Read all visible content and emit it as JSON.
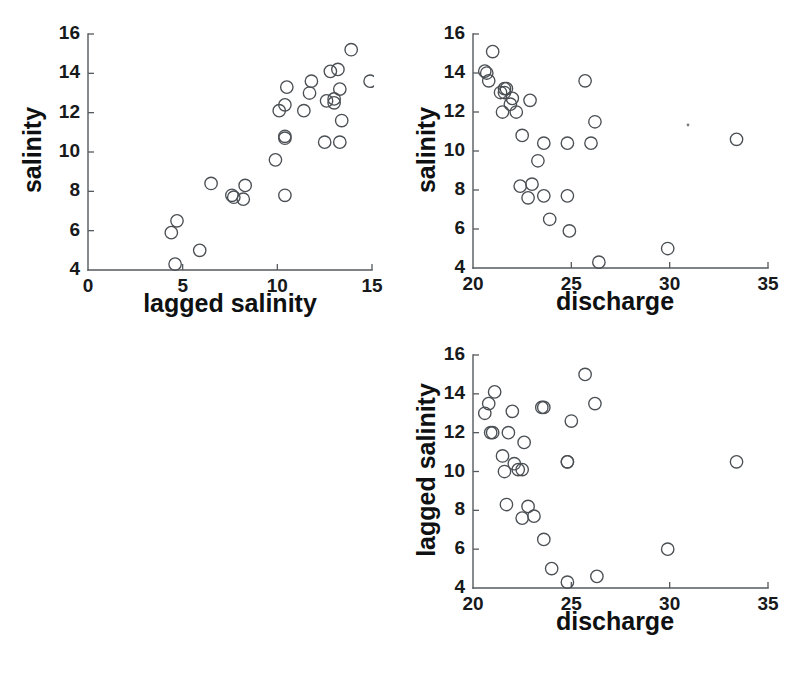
{
  "figure": {
    "background_color": "#ffffff",
    "marker_color": "#4a4f54",
    "axis_color": "#555a5e",
    "text_color": "#17191b",
    "marker_shape": "open-circle",
    "layout": "scatter-plot-matrix-lower-triangle",
    "panel_count": 3
  },
  "chart_data": [
    {
      "id": "panel-salinity-vs-lagged-salinity",
      "type": "scatter",
      "title": "",
      "xlabel": "lagged salinity",
      "ylabel": "salinity",
      "xlim": [
        0,
        15
      ],
      "ylim": [
        4,
        16
      ],
      "xticks": [
        0,
        5,
        10,
        15
      ],
      "yticks": [
        4,
        6,
        8,
        10,
        12,
        14,
        16
      ],
      "xtick_labels": [
        "0",
        "5",
        "10",
        "15"
      ],
      "ytick_labels": [
        "4",
        "6",
        "8",
        "10",
        "12",
        "14",
        "16"
      ],
      "grid": false,
      "legend": false,
      "x": [
        13.9,
        12.8,
        13.2,
        11.8,
        11.7,
        13.3,
        10.5,
        10.1,
        10.4,
        13.0,
        13.0,
        12.6,
        11.4,
        9.9,
        14.9,
        13.4,
        10.4,
        10.4,
        12.5,
        13.3,
        7.6,
        8.3,
        8.2,
        6.5,
        7.7,
        5.9,
        4.7,
        4.4,
        4.6,
        10.4
      ],
      "y": [
        15.2,
        14.1,
        14.2,
        13.6,
        13.0,
        13.2,
        13.3,
        12.1,
        12.4,
        12.7,
        12.5,
        12.6,
        12.1,
        9.6,
        13.6,
        11.6,
        10.8,
        10.7,
        10.5,
        10.5,
        7.8,
        8.3,
        7.6,
        8.4,
        7.7,
        5.0,
        6.5,
        5.9,
        4.3,
        7.8
      ]
    },
    {
      "id": "panel-salinity-vs-discharge",
      "type": "scatter",
      "title": "",
      "xlabel": "discharge",
      "ylabel": "salinity",
      "xlim": [
        20,
        35
      ],
      "ylim": [
        4,
        16
      ],
      "xticks": [
        20,
        25,
        30,
        35
      ],
      "yticks": [
        4,
        6,
        8,
        10,
        12,
        14,
        16
      ],
      "xtick_labels": [
        "20",
        "25",
        "30",
        "35"
      ],
      "ytick_labels": [
        "4",
        "6",
        "8",
        "10",
        "12",
        "14",
        "16"
      ],
      "grid": false,
      "legend": false,
      "x": [
        21.0,
        20.6,
        20.7,
        20.8,
        21.4,
        21.6,
        21.7,
        22.0,
        21.9,
        21.5,
        22.2,
        22.9,
        23.6,
        25.7,
        22.5,
        23.3,
        24.8,
        26.2,
        33.4,
        22.4,
        21.6,
        23.0,
        22.8,
        23.6,
        24.8,
        23.9,
        24.9,
        26.4,
        29.9,
        26.0
      ],
      "y": [
        15.1,
        14.1,
        14.0,
        13.6,
        13.0,
        13.2,
        13.2,
        12.7,
        12.4,
        12.0,
        12.0,
        12.6,
        10.4,
        13.6,
        10.8,
        9.5,
        10.4,
        11.5,
        10.6,
        8.2,
        13.0,
        8.3,
        7.6,
        7.7,
        7.7,
        6.5,
        5.9,
        4.3,
        5.0,
        10.4
      ]
    },
    {
      "id": "panel-lagged-salinity-vs-discharge",
      "type": "scatter",
      "title": "",
      "xlabel": "discharge",
      "ylabel": "lagged salinity",
      "xlim": [
        20,
        35
      ],
      "ylim": [
        4,
        16
      ],
      "xticks": [
        20,
        25,
        30,
        35
      ],
      "yticks": [
        4,
        6,
        8,
        10,
        12,
        14,
        16
      ],
      "xtick_labels": [
        "20",
        "25",
        "30",
        "35"
      ],
      "ytick_labels": [
        "4",
        "6",
        "8",
        "10",
        "12",
        "14",
        "16"
      ],
      "grid": false,
      "legend": false,
      "x": [
        25.7,
        21.1,
        20.8,
        20.6,
        22.0,
        23.5,
        23.6,
        26.2,
        25.0,
        21.0,
        20.9,
        21.8,
        22.6,
        24.8,
        21.5,
        22.1,
        21.6,
        22.3,
        24.8,
        21.7,
        22.8,
        23.1,
        22.5,
        23.6,
        29.9,
        24.0,
        24.8,
        26.3,
        33.4,
        22.5
      ],
      "y": [
        15.0,
        14.1,
        13.5,
        13.0,
        13.1,
        13.3,
        13.3,
        13.5,
        12.6,
        12.0,
        12.0,
        12.0,
        11.5,
        10.5,
        10.8,
        10.4,
        10.0,
        10.1,
        10.5,
        8.3,
        8.2,
        7.7,
        7.6,
        6.5,
        6.0,
        5.0,
        4.3,
        4.6,
        10.5,
        10.1
      ]
    }
  ],
  "panels": [
    {
      "name": "panel-1",
      "ylabel": "salinity",
      "xlabel": "lagged salinity"
    },
    {
      "name": "panel-2",
      "ylabel": "salinity",
      "xlabel": "discharge"
    },
    {
      "name": "panel-3",
      "ylabel": "lagged salinity",
      "xlabel": "discharge"
    }
  ]
}
